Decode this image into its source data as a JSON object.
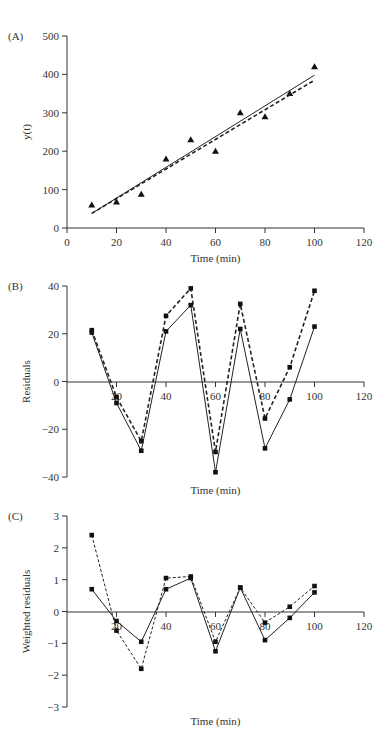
{
  "chart_data": [
    {
      "panel": "(A)",
      "type": "scatter",
      "title": "",
      "xlabel": "Time (min)",
      "ylabel": "y(t)",
      "xlim": [
        0,
        120
      ],
      "ylim": [
        0,
        500
      ],
      "xticks": [
        0,
        20,
        40,
        60,
        80,
        100,
        120
      ],
      "yticks": [
        0,
        100,
        200,
        300,
        400,
        500
      ],
      "grid": false,
      "x": [
        10,
        20,
        30,
        40,
        50,
        60,
        70,
        80,
        90,
        100
      ],
      "series": [
        {
          "name": "observed",
          "style": "triangle-markers",
          "values": [
            60,
            68,
            88,
            180,
            230,
            200,
            300,
            290,
            350,
            420
          ]
        },
        {
          "name": "fit-solid",
          "style": "solid-line",
          "x": [
            10,
            100
          ],
          "values": [
            38,
            398
          ]
        },
        {
          "name": "fit-dashed",
          "style": "dashed-line",
          "x": [
            10,
            100
          ],
          "values": [
            38,
            385
          ]
        }
      ]
    },
    {
      "panel": "(B)",
      "type": "line",
      "title": "",
      "xlabel": "Time (min)",
      "ylabel": "Residuals",
      "xlim": [
        0,
        120
      ],
      "ylim": [
        -40,
        40
      ],
      "xticks": [
        20,
        40,
        60,
        80,
        100,
        120
      ],
      "yticks": [
        -40,
        -20,
        0,
        20,
        40
      ],
      "grid": false,
      "x": [
        10,
        20,
        30,
        40,
        50,
        60,
        70,
        80,
        90,
        100
      ],
      "series": [
        {
          "name": "solid",
          "style": "solid-line-square-markers",
          "values": [
            20.5,
            -9,
            -29,
            21,
            32,
            -38,
            22,
            -28,
            -7.5,
            23
          ]
        },
        {
          "name": "dashed",
          "style": "dashed-line-square-markers",
          "values": [
            21.5,
            -6.5,
            -25,
            27.5,
            39,
            -29.5,
            32.5,
            -15.5,
            6,
            38
          ]
        }
      ]
    },
    {
      "panel": "(C)",
      "type": "line",
      "title": "",
      "xlabel": "Time (min)",
      "ylabel": "Weighted residuals",
      "xlim": [
        0,
        120
      ],
      "ylim": [
        -3,
        3
      ],
      "xticks": [
        20,
        40,
        60,
        80,
        100,
        120
      ],
      "yticks": [
        -3,
        -2,
        -1,
        0,
        1,
        2,
        3
      ],
      "grid": false,
      "x": [
        10,
        20,
        30,
        40,
        50,
        60,
        70,
        80,
        90,
        100
      ],
      "series": [
        {
          "name": "solid",
          "style": "solid-line-square-markers",
          "values": [
            0.7,
            -0.3,
            -0.95,
            0.7,
            1.05,
            -1.25,
            0.75,
            -0.9,
            -0.2,
            0.6
          ]
        },
        {
          "name": "dashed",
          "style": "dashed-line-square-markers",
          "values": [
            2.4,
            -0.6,
            -1.8,
            1.05,
            1.1,
            -0.95,
            0.75,
            -0.35,
            0.15,
            0.8
          ]
        }
      ]
    }
  ],
  "layout": {
    "panels": [
      {
        "x0px": 67,
        "x1px": 364,
        "ytop": 36,
        "ybot": 228,
        "xaxis_y": 228,
        "xlabel_y": 262
      },
      {
        "x0px": 67,
        "x1px": 364,
        "ytop": 286,
        "ybot": 477,
        "xaxis_y": 382,
        "xlabel_y": 494
      },
      {
        "x0px": 67,
        "x1px": 364,
        "ytop": 516,
        "ybot": 707,
        "xaxis_y": 612,
        "xlabel_y": 725
      }
    ]
  }
}
